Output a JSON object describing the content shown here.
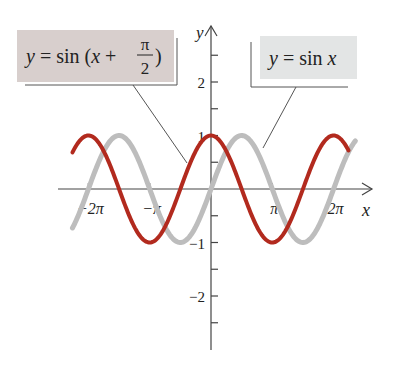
{
  "chart_data": {
    "type": "line",
    "title": "",
    "xlabel": "x",
    "ylabel": "y",
    "xlim": [
      -6.9,
      6.8
    ],
    "ylim": [
      -3.0,
      3.0
    ],
    "grid": false,
    "legend_position": "callout labels above plot",
    "x_ticks": [
      {
        "value": -6.2832,
        "label": "-2π"
      },
      {
        "value": -3.1416,
        "label": "-π"
      },
      {
        "value": 3.1416,
        "label": "π"
      },
      {
        "value": 6.2832,
        "label": "2π"
      }
    ],
    "y_ticks": [
      {
        "value": 2,
        "label": "2"
      },
      {
        "value": 1,
        "label": "1"
      },
      {
        "value": -1,
        "label": "-1"
      },
      {
        "value": -2,
        "label": "-2"
      }
    ],
    "y_minor_ticks": [
      2.5,
      1.5,
      0.5,
      -0.5,
      -1.5,
      -2.5
    ],
    "series": [
      {
        "name": "y = sin x",
        "color": "#bdbdbd",
        "domain": [
          -7.1,
          7.4
        ],
        "phase": 0
      },
      {
        "name": "y = sin (x + π/2)",
        "color": "#b22a1e",
        "domain": [
          -7.1,
          7.05
        ],
        "phase": 1.5708
      }
    ],
    "x": [
      -6.2832,
      -4.7124,
      -3.1416,
      -1.5708,
      0,
      1.5708,
      3.1416,
      4.7124,
      6.2832
    ],
    "values_sin_x": [
      0,
      1,
      0,
      -1,
      0,
      1,
      0,
      -1,
      0
    ],
    "values_sin_x_plus_half_pi": [
      1,
      0,
      -1,
      0,
      1,
      0,
      -1,
      0,
      1
    ]
  },
  "labels": {
    "shifted": {
      "prefix": "y = sin (x + ",
      "num": "π",
      "den": "2",
      "suffix": ")",
      "bg": "#d8cfcd"
    },
    "base": {
      "text": "y = sin x",
      "bg": "#e3e5e5"
    }
  },
  "axes": {
    "x_name": "x",
    "y_name": "y",
    "color": "#444444"
  }
}
